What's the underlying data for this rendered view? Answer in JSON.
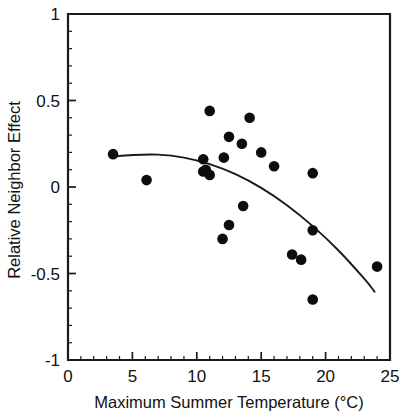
{
  "chart_data": {
    "type": "scatter",
    "title": "",
    "xlabel": "Maximum Summer Temperature (°C)",
    "ylabel": "Relative Neighbor Effect",
    "xlim": [
      0,
      25
    ],
    "ylim": [
      -1,
      1
    ],
    "x_major_ticks": [
      0,
      5,
      10,
      15,
      20,
      25
    ],
    "x_tick_labels": [
      "0",
      "5",
      "10",
      "15",
      "20",
      "25"
    ],
    "x_minor_tick_step": 1,
    "y_major_ticks": [
      1,
      0.5,
      0,
      -0.5,
      -1
    ],
    "y_tick_labels": [
      "1",
      "0.5",
      "0",
      "-0.5",
      "-1"
    ],
    "y_minor_tick_step": 0.1,
    "grid": false,
    "legend": null,
    "point_color": "#0d0d0d",
    "curve_color": "#1a1a1a",
    "axis_color": "#1a1a1a",
    "background_color": "#ffffff",
    "points": [
      {
        "x": 3.5,
        "y": 0.19
      },
      {
        "x": 6.1,
        "y": 0.04
      },
      {
        "x": 10.5,
        "y": 0.16
      },
      {
        "x": 10.5,
        "y": 0.09
      },
      {
        "x": 10.7,
        "y": 0.1
      },
      {
        "x": 11.0,
        "y": 0.07
      },
      {
        "x": 11.0,
        "y": 0.44
      },
      {
        "x": 12.0,
        "y": -0.3
      },
      {
        "x": 12.1,
        "y": 0.17
      },
      {
        "x": 12.5,
        "y": 0.29
      },
      {
        "x": 12.5,
        "y": -0.22
      },
      {
        "x": 13.5,
        "y": 0.25
      },
      {
        "x": 13.6,
        "y": -0.11
      },
      {
        "x": 14.1,
        "y": 0.4
      },
      {
        "x": 15.0,
        "y": 0.2
      },
      {
        "x": 16.0,
        "y": 0.12
      },
      {
        "x": 17.4,
        "y": -0.39
      },
      {
        "x": 18.1,
        "y": -0.42
      },
      {
        "x": 19.0,
        "y": 0.08
      },
      {
        "x": 19.0,
        "y": -0.25
      },
      {
        "x": 19.0,
        "y": -0.65
      },
      {
        "x": 24.0,
        "y": -0.46
      }
    ],
    "fit_curve": {
      "type": "quadratic",
      "x_start": 3.5,
      "x_end": 23.8,
      "points": [
        {
          "x": 3.5,
          "y": 0.175
        },
        {
          "x": 5.0,
          "y": 0.185
        },
        {
          "x": 7.0,
          "y": 0.187
        },
        {
          "x": 9.0,
          "y": 0.17
        },
        {
          "x": 11.0,
          "y": 0.132
        },
        {
          "x": 13.0,
          "y": 0.074
        },
        {
          "x": 15.0,
          "y": -0.005
        },
        {
          "x": 17.0,
          "y": -0.105
        },
        {
          "x": 19.0,
          "y": -0.226
        },
        {
          "x": 21.0,
          "y": -0.367
        },
        {
          "x": 23.0,
          "y": -0.53
        },
        {
          "x": 23.8,
          "y": -0.605
        }
      ]
    }
  }
}
